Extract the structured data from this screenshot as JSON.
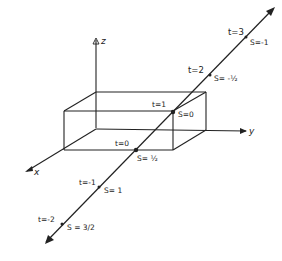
{
  "diagram": {
    "axes": {
      "z": {
        "label": "z"
      },
      "y": {
        "label": "y"
      },
      "x": {
        "label": "x"
      }
    },
    "line_points": [
      {
        "t_label": "t=3",
        "s_label": "S=-1",
        "x": 246,
        "y": 37
      },
      {
        "t_label": "t=2",
        "s_label": "S= -½",
        "x": 210,
        "y": 75
      },
      {
        "t_label": "t=1",
        "s_label": "S=0",
        "x": 173,
        "y": 112
      },
      {
        "t_label": "t=0",
        "s_label": "S= ½",
        "x": 136,
        "y": 150
      },
      {
        "t_label": "t=-1",
        "s_label": "S= 1",
        "x": 99,
        "y": 187
      },
      {
        "t_label": "t=-2",
        "s_label": "S = 3/2",
        "x": 62,
        "y": 224
      }
    ],
    "colors": {
      "stroke": "#222222",
      "background": "#ffffff"
    }
  }
}
